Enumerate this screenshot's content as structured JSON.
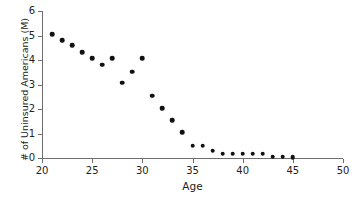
{
  "chart_data": {
    "type": "scatter",
    "title": "",
    "xlabel": "Age",
    "ylabel": "# of Uninsured Americans (M)",
    "xlim": [
      20,
      50
    ],
    "ylim": [
      0,
      6
    ],
    "xticks": [
      20,
      25,
      30,
      35,
      40,
      45,
      50
    ],
    "yticks": [
      0,
      1,
      2,
      3,
      4,
      5,
      6
    ],
    "grid": false,
    "legend": null,
    "marker": "circle",
    "marker_color": "#111111",
    "axis_color": "#6e6e6e",
    "background_color": "#ffffff",
    "x": [
      21,
      22,
      23,
      24,
      25,
      26,
      27,
      28,
      29,
      30,
      31,
      32,
      33,
      34,
      35,
      36,
      37,
      38,
      39,
      40,
      41,
      42,
      43,
      44,
      45
    ],
    "values": [
      5.05,
      4.8,
      4.6,
      4.32,
      4.07,
      3.8,
      4.07,
      3.08,
      3.52,
      4.08,
      2.55,
      2.03,
      1.55,
      1.05,
      0.5,
      0.5,
      0.3,
      0.18,
      0.18,
      0.18,
      0.18,
      0.18,
      0.05,
      0.05,
      0.04
    ],
    "points": [
      {
        "age": 21,
        "value": 5.05
      },
      {
        "age": 22,
        "value": 4.8
      },
      {
        "age": 23,
        "value": 4.6
      },
      {
        "age": 24,
        "value": 4.32
      },
      {
        "age": 25,
        "value": 4.07
      },
      {
        "age": 26,
        "value": 3.8
      },
      {
        "age": 27,
        "value": 4.07
      },
      {
        "age": 28,
        "value": 3.08
      },
      {
        "age": 29,
        "value": 3.52
      },
      {
        "age": 30,
        "value": 4.08
      },
      {
        "age": 31,
        "value": 2.55
      },
      {
        "age": 32,
        "value": 2.03
      },
      {
        "age": 33,
        "value": 1.55
      },
      {
        "age": 34,
        "value": 1.05
      },
      {
        "age": 35,
        "value": 0.5
      },
      {
        "age": 36,
        "value": 0.5
      },
      {
        "age": 37,
        "value": 0.3
      },
      {
        "age": 38,
        "value": 0.18
      },
      {
        "age": 39,
        "value": 0.18
      },
      {
        "age": 40,
        "value": 0.18
      },
      {
        "age": 41,
        "value": 0.18
      },
      {
        "age": 42,
        "value": 0.18
      },
      {
        "age": 43,
        "value": 0.05
      },
      {
        "age": 44,
        "value": 0.05
      },
      {
        "age": 45,
        "value": 0.04
      }
    ]
  }
}
